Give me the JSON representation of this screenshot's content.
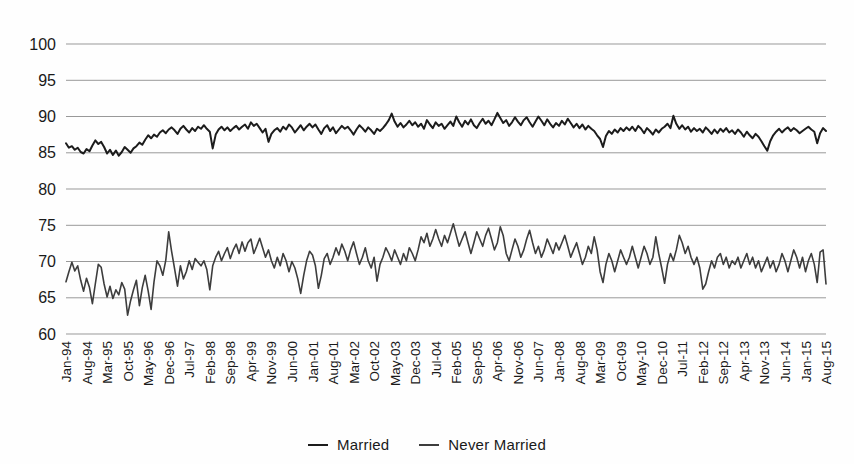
{
  "figure": {
    "kind": "scanned-statistical-line-chart"
  },
  "colors": {
    "background": "#fefefe",
    "gridline": "#999999",
    "text": "#1a1a1a",
    "married_line": "#1c1c1c",
    "never_married_line": "#3d3d3d"
  },
  "chart_data": {
    "type": "line",
    "title": "",
    "xlabel": "",
    "ylabel": "",
    "ylim": [
      60,
      100
    ],
    "yticks": [
      100,
      95,
      90,
      85,
      80,
      75,
      70,
      65,
      60
    ],
    "grid": true,
    "legend_position": "bottom-center",
    "x_unit": "month",
    "x_start": "Jan-94",
    "x_end": "Aug-15",
    "n_points": 260,
    "xtick_interval_months": 7,
    "xtick_labels": [
      "Jan-94",
      "Aug-94",
      "Mar-95",
      "Oct-95",
      "May-96",
      "Dec-96",
      "Jul-97",
      "Feb-98",
      "Sep-98",
      "Apr-99",
      "Nov-99",
      "Jun-00",
      "Jan-01",
      "Aug-01",
      "Mar-02",
      "Oct-02",
      "May-03",
      "Dec-03",
      "Jul-04",
      "Feb-05",
      "Sep-05",
      "Apr-06",
      "Nov-06",
      "Jun-07",
      "Jan-08",
      "Aug-08",
      "Mar-09",
      "Oct-09",
      "May-10",
      "Dec-10",
      "Jul-11",
      "Feb-12",
      "Sep-12",
      "Apr-13",
      "Nov-13",
      "Jun-14",
      "Jan-15",
      "Aug-15"
    ],
    "series": [
      {
        "name": "Married",
        "color": "#1c1c1c",
        "width": 2,
        "values": [
          86.3,
          85.7,
          85.9,
          85.4,
          85.7,
          85.1,
          84.9,
          85.5,
          85.2,
          86.0,
          86.7,
          86.2,
          86.5,
          85.8,
          84.9,
          85.4,
          84.7,
          85.3,
          84.6,
          85.1,
          85.8,
          85.4,
          85.0,
          85.6,
          85.9,
          86.4,
          86.1,
          86.8,
          87.4,
          87.0,
          87.5,
          87.2,
          87.8,
          88.1,
          87.7,
          88.2,
          88.5,
          88.1,
          87.6,
          88.3,
          88.7,
          88.2,
          87.8,
          88.4,
          88.0,
          88.6,
          88.3,
          88.8,
          88.3,
          87.9,
          85.6,
          87.5,
          88.2,
          88.6,
          88.1,
          88.5,
          88.0,
          88.4,
          88.7,
          88.2,
          88.6,
          88.9,
          88.3,
          89.2,
          88.7,
          89.0,
          88.4,
          87.8,
          88.3,
          86.5,
          87.6,
          88.1,
          88.4,
          87.9,
          88.6,
          88.2,
          88.9,
          88.5,
          87.8,
          88.3,
          88.8,
          88.1,
          88.6,
          89.0,
          88.5,
          88.9,
          88.2,
          87.6,
          88.4,
          88.8,
          88.0,
          88.5,
          87.7,
          88.2,
          88.7,
          88.3,
          88.6,
          88.1,
          87.5,
          88.2,
          88.8,
          88.4,
          87.9,
          88.5,
          88.1,
          87.6,
          88.3,
          88.0,
          88.4,
          88.9,
          89.5,
          90.4,
          89.3,
          88.6,
          89.1,
          88.5,
          88.9,
          89.4,
          88.8,
          89.2,
          88.6,
          89.0,
          88.3,
          89.5,
          88.9,
          88.4,
          89.2,
          88.7,
          89.0,
          88.3,
          88.8,
          89.3,
          88.7,
          90.0,
          89.2,
          88.6,
          89.4,
          88.9,
          89.6,
          88.8,
          88.4,
          89.1,
          89.7,
          89.0,
          89.4,
          88.8,
          89.6,
          90.5,
          89.8,
          89.1,
          89.5,
          88.7,
          89.2,
          89.9,
          89.3,
          88.8,
          89.5,
          89.9,
          89.2,
          88.6,
          89.3,
          90.0,
          89.4,
          88.8,
          89.6,
          89.0,
          88.5,
          89.1,
          88.7,
          89.4,
          88.9,
          89.7,
          89.1,
          88.5,
          89.0,
          88.4,
          88.9,
          88.2,
          88.7,
          88.3,
          88.0,
          87.4,
          86.9,
          85.8,
          87.3,
          88.0,
          87.6,
          88.2,
          87.8,
          88.4,
          88.0,
          88.5,
          88.1,
          88.6,
          88.0,
          88.7,
          88.3,
          87.7,
          88.4,
          88.0,
          87.5,
          88.2,
          87.8,
          88.3,
          88.6,
          89.0,
          88.4,
          90.1,
          89.0,
          88.3,
          88.8,
          88.2,
          88.6,
          87.9,
          88.4,
          88.0,
          88.3,
          87.8,
          88.5,
          88.1,
          87.6,
          88.2,
          87.7,
          88.3,
          87.9,
          88.4,
          87.8,
          88.1,
          87.6,
          88.2,
          87.8,
          87.2,
          87.9,
          87.4,
          87.0,
          87.6,
          87.2,
          86.6,
          85.9,
          85.3,
          86.6,
          87.4,
          87.9,
          88.3,
          87.8,
          88.2,
          88.5,
          88.0,
          88.4,
          88.1,
          87.7,
          88.0,
          88.3,
          88.6,
          88.2,
          87.9,
          86.3,
          87.7,
          88.4,
          88.0
        ]
      },
      {
        "name": "Never Married",
        "color": "#3d3d3d",
        "width": 1.6,
        "values": [
          67.2,
          68.6,
          69.9,
          68.7,
          69.4,
          67.4,
          65.9,
          67.7,
          66.4,
          64.2,
          66.9,
          69.6,
          69.2,
          66.9,
          65.1,
          66.6,
          64.9,
          66.1,
          65.4,
          67.1,
          66.2,
          62.6,
          64.6,
          66.1,
          67.4,
          63.9,
          66.4,
          68.1,
          65.9,
          63.4,
          67.2,
          70.1,
          69.4,
          68.1,
          70.2,
          74.1,
          71.4,
          69.0,
          66.6,
          69.4,
          67.6,
          68.6,
          70.1,
          68.9,
          70.4,
          69.9,
          69.4,
          70.1,
          68.9,
          66.1,
          69.4,
          70.6,
          71.4,
          70.1,
          71.1,
          71.9,
          70.4,
          71.6,
          72.4,
          71.1,
          72.7,
          71.4,
          72.6,
          73.1,
          71.1,
          72.1,
          73.2,
          71.9,
          70.6,
          71.6,
          70.1,
          69.1,
          70.6,
          69.4,
          71.1,
          70.1,
          68.6,
          70.0,
          69.1,
          67.6,
          65.6,
          68.1,
          70.1,
          71.4,
          70.9,
          69.4,
          66.3,
          68.1,
          70.4,
          71.1,
          69.6,
          70.6,
          71.9,
          70.9,
          72.4,
          71.4,
          70.1,
          71.6,
          72.7,
          71.1,
          69.6,
          70.6,
          71.9,
          70.1,
          69.1,
          70.6,
          67.3,
          69.6,
          70.6,
          71.9,
          71.1,
          70.1,
          71.6,
          70.6,
          69.6,
          71.1,
          70.1,
          71.9,
          71.1,
          70.1,
          71.6,
          73.4,
          72.6,
          73.9,
          72.1,
          73.1,
          74.4,
          73.1,
          72.1,
          73.6,
          72.6,
          73.9,
          75.2,
          73.6,
          72.1,
          73.1,
          74.1,
          72.6,
          71.1,
          72.6,
          74.1,
          73.1,
          72.1,
          73.6,
          74.6,
          73.1,
          71.6,
          72.6,
          74.8,
          73.6,
          71.1,
          70.1,
          71.6,
          73.1,
          72.1,
          70.6,
          71.6,
          73.1,
          74.3,
          72.6,
          71.1,
          72.1,
          70.6,
          71.6,
          73.1,
          72.1,
          71.1,
          72.6,
          71.6,
          72.6,
          73.6,
          72.1,
          70.6,
          71.6,
          72.6,
          71.1,
          69.6,
          70.6,
          72.1,
          71.1,
          73.4,
          71.6,
          68.6,
          67.1,
          69.6,
          71.1,
          70.1,
          68.6,
          70.1,
          71.6,
          70.6,
          69.6,
          70.6,
          72.1,
          70.6,
          69.1,
          70.6,
          72.1,
          71.1,
          69.6,
          70.6,
          73.4,
          71.1,
          69.1,
          67.0,
          69.6,
          71.1,
          70.1,
          71.6,
          73.6,
          72.6,
          71.1,
          72.1,
          70.6,
          69.6,
          70.6,
          69.1,
          66.2,
          66.9,
          68.6,
          70.1,
          69.1,
          70.6,
          71.1,
          69.6,
          70.6,
          69.1,
          70.1,
          69.6,
          70.6,
          69.1,
          70.1,
          71.1,
          69.6,
          70.6,
          69.1,
          70.1,
          68.6,
          69.6,
          70.6,
          69.1,
          70.1,
          68.6,
          69.6,
          71.1,
          70.1,
          68.6,
          70.1,
          71.6,
          70.6,
          69.1,
          70.6,
          68.6,
          70.1,
          71.1,
          69.6,
          67.1,
          71.3,
          71.6,
          66.9
        ]
      }
    ]
  }
}
